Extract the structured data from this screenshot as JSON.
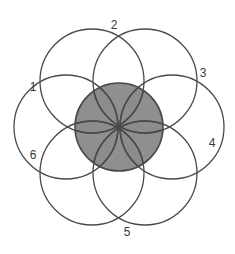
{
  "figure": {
    "background_color": "#ffffff",
    "canvas": {
      "width": 235,
      "height": 254
    },
    "center": {
      "x": 119,
      "y": 127
    },
    "outline_color": "#4a4a4a",
    "outline_width": 1.3,
    "petal_radius": 52,
    "petal_ring_distance": 53,
    "core": {
      "radius": 44,
      "fill_light": "#a9a9a9",
      "fill_dark": "#8b8b8b",
      "stroke": "#4a4a4a"
    },
    "circles": [
      {
        "id": 1,
        "label": "1",
        "angle_deg": 180,
        "cx": 66,
        "cy": 127,
        "label_x": 33,
        "label_y": 88
      },
      {
        "id": 2,
        "label": "2",
        "angle_deg": 240,
        "cx": 92,
        "cy": 81,
        "label_x": 114,
        "label_y": 26
      },
      {
        "id": 3,
        "label": "3",
        "angle_deg": 300,
        "cx": 145,
        "cy": 81,
        "label_x": 203,
        "label_y": 74
      },
      {
        "id": 4,
        "label": "4",
        "angle_deg": 0,
        "cx": 172,
        "cy": 127,
        "label_x": 212,
        "label_y": 144
      },
      {
        "id": 5,
        "label": "5",
        "angle_deg": 60,
        "cx": 145,
        "cy": 173,
        "label_x": 127,
        "label_y": 233
      },
      {
        "id": 6,
        "label": "6",
        "angle_deg": 120,
        "cx": 92,
        "cy": 173,
        "label_x": 33,
        "label_y": 156
      }
    ]
  }
}
